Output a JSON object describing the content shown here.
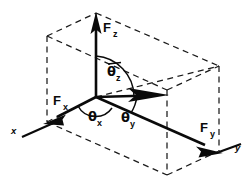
{
  "figure": {
    "type": "vector-diagram",
    "background_color": "#ffffff",
    "line_color": "#0a0a0a",
    "dash_color": "#1a1a1a",
    "width": 252,
    "height": 185
  },
  "vectors": [
    {
      "id": "fz",
      "label_main": "F",
      "label_sub": "z",
      "description": "vertical z-component force vector pointing up",
      "origin": [
        96,
        97
      ],
      "tip": [
        96,
        14
      ],
      "label_pos": [
        103,
        29
      ]
    },
    {
      "id": "fx",
      "label_main": "F",
      "label_sub": "x",
      "description": "x-component force vector pointing down-left",
      "origin": [
        96,
        97
      ],
      "tip": [
        47,
        122
      ],
      "label_pos": [
        55,
        104
      ]
    },
    {
      "id": "fy",
      "label_main": "F",
      "label_sub": "y",
      "description": "y-component force vector pointing down-right",
      "origin": [
        96,
        97
      ],
      "tip": [
        219,
        151
      ],
      "label_pos": [
        203,
        130
      ]
    },
    {
      "id": "resultant",
      "label_main": "",
      "label_sub": "",
      "description": "resultant force vector pointing right",
      "origin": [
        96,
        97
      ],
      "tip": [
        166,
        95
      ],
      "label_pos": [
        0,
        0
      ]
    }
  ],
  "angles": [
    {
      "id": "theta-z",
      "symbol": "θ",
      "subscript": "z",
      "description": "angle between resultant and z-axis",
      "label_pos": [
        110,
        73
      ],
      "has_overbar": true
    },
    {
      "id": "theta-x",
      "symbol": "θ",
      "subscript": "x",
      "description": "angle between resultant and x-axis",
      "label_pos": [
        93,
        119
      ],
      "has_overbar": false
    },
    {
      "id": "theta-y",
      "symbol": "θ",
      "subscript": "y",
      "description": "angle between resultant and y-axis",
      "label_pos": [
        126,
        120
      ],
      "has_overbar": false
    }
  ],
  "axes": [
    {
      "id": "x-axis",
      "label": "x",
      "description": "x axis stub at lower left",
      "label_pos": [
        13,
        132
      ],
      "line": [
        22,
        137,
        58,
        121
      ]
    },
    {
      "id": "y-axis",
      "label": "y",
      "description": "y axis stub at lower right",
      "label_pos": [
        237,
        148
      ],
      "line": [
        217,
        153,
        240,
        144
      ]
    }
  ],
  "box": {
    "description": "dashed rectangular parallelepiped construction box",
    "style": "dashed",
    "vertices": {
      "front_bottom_left": [
        47,
        122
      ],
      "front_bottom_right": [
        167,
        175
      ],
      "back_bottom_left": [
        96,
        97
      ],
      "back_bottom_right": [
        219,
        151
      ],
      "front_top_left": [
        47,
        36
      ],
      "front_top_right": [
        167,
        90
      ],
      "back_top_left": [
        96,
        13
      ],
      "back_top_right": [
        219,
        66
      ]
    }
  }
}
